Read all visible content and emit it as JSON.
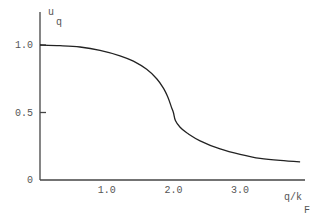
{
  "chart_data": {
    "type": "line",
    "title": "",
    "xlabel": "q/k",
    "xlabel_subscript": "F",
    "ylabel": "u",
    "ylabel_subscript": "q",
    "xlim": [
      0,
      4.0
    ],
    "ylim": [
      0,
      1.1
    ],
    "grid": false,
    "x_ticks": [
      {
        "value": 1.0,
        "label": "1.0"
      },
      {
        "value": 2.0,
        "label": "2.0"
      },
      {
        "value": 3.0,
        "label": "3.0"
      }
    ],
    "y_ticks": [
      {
        "value": 0,
        "label": "0"
      },
      {
        "value": 0.5,
        "label": "0.5"
      },
      {
        "value": 1.0,
        "label": "1.0"
      }
    ],
    "series": [
      {
        "name": "u_q",
        "x": [
          0.0,
          0.3,
          0.6,
          0.9,
          1.2,
          1.4,
          1.6,
          1.75,
          1.85,
          1.92,
          1.97,
          2.0,
          2.03,
          2.1,
          2.2,
          2.4,
          2.7,
          3.0,
          3.3,
          3.6,
          3.9
        ],
        "y": [
          1.0,
          0.995,
          0.985,
          0.96,
          0.92,
          0.88,
          0.82,
          0.75,
          0.68,
          0.61,
          0.54,
          0.5,
          0.44,
          0.39,
          0.35,
          0.29,
          0.23,
          0.19,
          0.16,
          0.145,
          0.135
        ]
      }
    ]
  }
}
